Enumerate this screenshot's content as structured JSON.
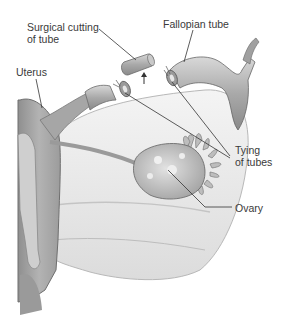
{
  "diagram": {
    "labels": [
      {
        "id": "surgical-cutting",
        "lines": [
          "Surgical cutting",
          "of tube"
        ]
      },
      {
        "id": "fallopian-tube",
        "lines": [
          "Fallopian tube"
        ]
      },
      {
        "id": "uterus",
        "lines": [
          "Uterus"
        ]
      },
      {
        "id": "tying-of-tubes",
        "lines": [
          "Tying",
          "of tubes"
        ]
      },
      {
        "id": "ovary",
        "lines": [
          "Ovary"
        ]
      }
    ]
  }
}
